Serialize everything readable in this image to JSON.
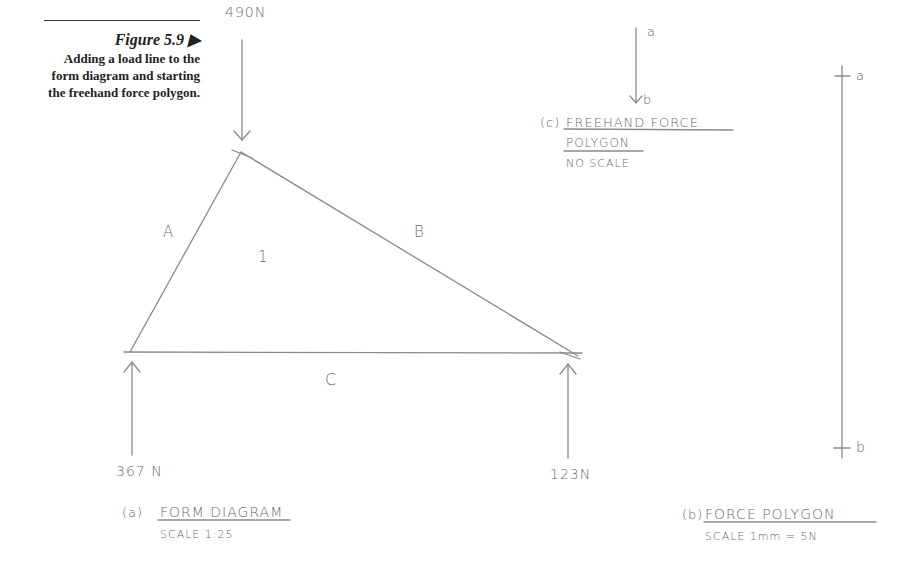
{
  "caption": {
    "figure_label": "Figure 5.9",
    "marker": "▶",
    "description_lines": [
      "Adding a load line to the",
      "form diagram and starting",
      "the freehand force polygon."
    ]
  },
  "form_diagram": {
    "load_top": "490N",
    "reaction_left": "367 N",
    "reaction_right": "123N",
    "space_labels": {
      "a": "A",
      "b": "B",
      "c": "C",
      "one": "1"
    },
    "title_prefix": "(a)",
    "title": "FORM DIAGRAM",
    "scale": "SCALE 1:25"
  },
  "force_polygon": {
    "point_a": "a",
    "point_b": "b",
    "title_prefix": "(b)",
    "title": "FORCE POLYGON",
    "scale": "SCALE 1mm = 5N"
  },
  "freehand_polygon": {
    "point_a": "a",
    "point_b": "b",
    "title_prefix": "(c)",
    "title_line1": "FREEHAND FORCE",
    "title_line2": "POLYGON",
    "scale": "NO SCALE"
  },
  "colors": {
    "line": "#8a8a8a",
    "text": "#6a6a6a",
    "caption": "#222222"
  }
}
